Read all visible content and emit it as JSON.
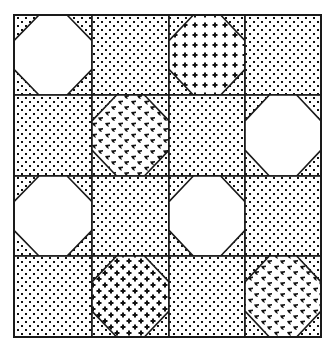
{
  "diagram": {
    "type": "quilt-block-pattern",
    "grid": {
      "rows": 4,
      "cols": 4
    },
    "colors": {
      "line": "#1a1a1a",
      "background": "#ffffff",
      "ink": "#111111"
    },
    "fills": {
      "dots": "staggered-dots",
      "plus-grid": "plus-signs-orthogonal",
      "plus-diag": "plus-signs-diagonal",
      "birds": "arrowhead-marks",
      "white": "solid-white"
    },
    "blocks": [
      [
        {
          "kind": "octagon",
          "fill": "white"
        },
        {
          "kind": "square",
          "fill": "dots"
        },
        {
          "kind": "octagon",
          "fill": "plus-grid"
        },
        {
          "kind": "square",
          "fill": "dots"
        }
      ],
      [
        {
          "kind": "square",
          "fill": "dots"
        },
        {
          "kind": "octagon",
          "fill": "birds"
        },
        {
          "kind": "square",
          "fill": "dots"
        },
        {
          "kind": "octagon",
          "fill": "white"
        }
      ],
      [
        {
          "kind": "octagon",
          "fill": "white"
        },
        {
          "kind": "square",
          "fill": "dots"
        },
        {
          "kind": "octagon",
          "fill": "white"
        },
        {
          "kind": "square",
          "fill": "dots"
        }
      ],
      [
        {
          "kind": "square",
          "fill": "dots"
        },
        {
          "kind": "octagon",
          "fill": "plus-diag"
        },
        {
          "kind": "square",
          "fill": "dots"
        },
        {
          "kind": "octagon",
          "fill": "birds"
        }
      ]
    ],
    "octagon_corner_fill": "dots"
  }
}
